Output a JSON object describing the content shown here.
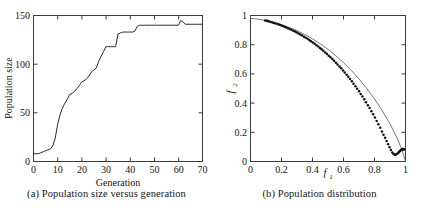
{
  "figure": {
    "panels": [
      {
        "id": "panel-a",
        "caption": "(a) Population size versus generation"
      },
      {
        "id": "panel-b",
        "caption": "(b) Population distribution"
      }
    ]
  },
  "chart_data": [
    {
      "type": "line",
      "panel": "a",
      "title": "",
      "caption": "(a) Population size versus generation",
      "xlabel": "Generation",
      "ylabel": "Population size",
      "xlim": [
        0,
        70
      ],
      "ylim": [
        0,
        150
      ],
      "xticks": [
        0,
        10,
        20,
        30,
        40,
        50,
        60,
        70
      ],
      "xtick_labels": [
        "0",
        "10",
        "20",
        "30",
        "40",
        "50",
        "60",
        "70"
      ],
      "yticks": [
        0,
        50,
        100,
        150
      ],
      "ytick_labels": [
        "0",
        "50",
        "100",
        "150"
      ],
      "grid": false,
      "legend": null,
      "series": [
        {
          "name": "Population size",
          "x": [
            0,
            1,
            2,
            3,
            4,
            5,
            6,
            7,
            8,
            9,
            10,
            11,
            12,
            13,
            14,
            15,
            16,
            17,
            18,
            19,
            20,
            21,
            22,
            23,
            24,
            25,
            26,
            27,
            28,
            29,
            30,
            31,
            32,
            33,
            34,
            35,
            36,
            37,
            38,
            39,
            40,
            41,
            42,
            43,
            44,
            45,
            46,
            47,
            48,
            49,
            50,
            51,
            52,
            53,
            54,
            55,
            56,
            57,
            58,
            59,
            60,
            61,
            62,
            63,
            64,
            65,
            66,
            67,
            68,
            69,
            70
          ],
          "values": [
            8,
            8,
            8,
            9,
            10,
            11,
            12,
            13,
            16,
            24,
            38,
            48,
            55,
            60,
            64,
            69,
            70,
            72,
            75,
            78,
            82,
            83,
            85,
            88,
            92,
            94,
            96,
            103,
            108,
            113,
            118,
            118,
            118,
            118,
            118,
            131,
            132,
            133,
            133,
            133,
            133,
            133,
            134,
            139,
            140,
            140,
            140,
            140,
            140,
            140,
            140,
            140,
            140,
            140,
            140,
            140,
            140,
            140,
            140,
            140,
            140,
            145,
            143,
            141,
            141,
            141,
            141,
            141,
            141,
            141,
            141
          ]
        }
      ]
    },
    {
      "type": "scatter",
      "panel": "b",
      "title": "",
      "caption": "(b) Population distribution",
      "xlabel": "f1",
      "ylabel": "f2",
      "xlim": [
        0,
        1
      ],
      "ylim": [
        0,
        1
      ],
      "xticks": [
        0,
        0.2,
        0.4,
        0.6,
        0.8,
        1
      ],
      "xtick_labels": [
        "0",
        "0.2",
        "0.4",
        "0.6",
        "0.8",
        "1"
      ],
      "yticks": [
        0,
        0.2,
        0.4,
        0.6,
        0.8,
        1
      ],
      "ytick_labels": [
        "0",
        "0.2",
        "0.4",
        "0.6",
        "0.8",
        "1"
      ],
      "grid": false,
      "legend": null,
      "series": [
        {
          "name": "Pareto front reference curve",
          "kind": "line",
          "x": [
            0,
            0.05,
            0.1,
            0.15,
            0.2,
            0.25,
            0.3,
            0.35,
            0.4,
            0.45,
            0.5,
            0.55,
            0.6,
            0.65,
            0.7,
            0.75,
            0.8,
            0.85,
            0.9,
            0.95,
            0.98,
            1
          ],
          "values": [
            0.98,
            0.975,
            0.965,
            0.952,
            0.937,
            0.918,
            0.896,
            0.87,
            0.84,
            0.806,
            0.768,
            0.725,
            0.677,
            0.624,
            0.565,
            0.5,
            0.428,
            0.348,
            0.258,
            0.152,
            0.07,
            0
          ]
        },
        {
          "name": "Population individuals",
          "kind": "points",
          "x": [
            0.095,
            0.105,
            0.112,
            0.12,
            0.131,
            0.143,
            0.152,
            0.163,
            0.175,
            0.186,
            0.197,
            0.208,
            0.219,
            0.229,
            0.241,
            0.252,
            0.264,
            0.276,
            0.287,
            0.298,
            0.31,
            0.321,
            0.333,
            0.345,
            0.356,
            0.368,
            0.379,
            0.39,
            0.402,
            0.414,
            0.425,
            0.437,
            0.448,
            0.459,
            0.47,
            0.482,
            0.493,
            0.505,
            0.516,
            0.528,
            0.539,
            0.551,
            0.562,
            0.574,
            0.585,
            0.597,
            0.608,
            0.62,
            0.631,
            0.642,
            0.654,
            0.665,
            0.677,
            0.688,
            0.7,
            0.711,
            0.722,
            0.734,
            0.745,
            0.757,
            0.768,
            0.78,
            0.791,
            0.803,
            0.814,
            0.825,
            0.837,
            0.848,
            0.858,
            0.868,
            0.878,
            0.888,
            0.897,
            0.906,
            0.915,
            0.923,
            0.931,
            0.938,
            0.945,
            0.951,
            0.957,
            0.962,
            0.967,
            0.972,
            0.976,
            0.98,
            0.983,
            0.986,
            0.988,
            0.99
          ],
          "values": [
            0.966,
            0.964,
            0.962,
            0.959,
            0.956,
            0.952,
            0.949,
            0.945,
            0.941,
            0.937,
            0.933,
            0.928,
            0.923,
            0.919,
            0.913,
            0.908,
            0.902,
            0.896,
            0.89,
            0.884,
            0.877,
            0.87,
            0.863,
            0.855,
            0.848,
            0.84,
            0.832,
            0.824,
            0.815,
            0.806,
            0.797,
            0.787,
            0.778,
            0.768,
            0.758,
            0.747,
            0.736,
            0.725,
            0.714,
            0.702,
            0.69,
            0.677,
            0.664,
            0.651,
            0.638,
            0.624,
            0.61,
            0.595,
            0.58,
            0.565,
            0.549,
            0.533,
            0.516,
            0.499,
            0.481,
            0.463,
            0.445,
            0.426,
            0.406,
            0.386,
            0.366,
            0.345,
            0.323,
            0.301,
            0.278,
            0.255,
            0.231,
            0.206,
            0.184,
            0.162,
            0.14,
            0.118,
            0.097,
            0.078,
            0.062,
            0.052,
            0.047,
            0.048,
            0.052,
            0.058,
            0.064,
            0.07,
            0.075,
            0.079,
            0.082,
            0.084,
            0.085,
            0.085,
            0.084,
            0.082
          ]
        }
      ]
    }
  ],
  "panel_a": {
    "ylabel": "Population size",
    "xlabel": "Generation",
    "ytick_labels": [
      "150",
      "100",
      "50",
      "0"
    ],
    "xtick_labels": [
      "0",
      "10",
      "20",
      "30",
      "40",
      "50",
      "60",
      "70"
    ],
    "caption": "(a) Population size versus generation"
  },
  "panel_b": {
    "ylabel_base": "f",
    "ylabel_sub": "2",
    "xlabel_base": "f",
    "xlabel_sub": "1",
    "ytick_labels": [
      "1",
      "0.8",
      "0.6",
      "0.4",
      "0.2",
      "0"
    ],
    "xtick_labels": [
      "0",
      "0.2",
      "0.4",
      "0.6",
      "0.8",
      "1"
    ],
    "caption": "(b) Population distribution"
  },
  "colors": {
    "line": "#2b2b2b",
    "frame": "#3c3c3c",
    "dot": "#101010",
    "background": "#ffffff"
  }
}
